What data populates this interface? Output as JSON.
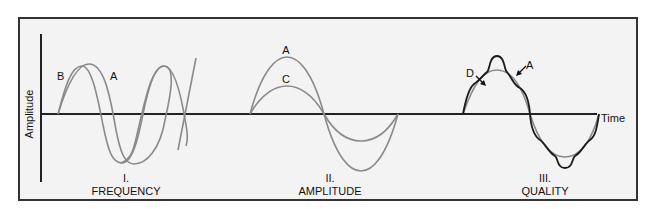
{
  "diagram": {
    "type": "sound-wave-properties",
    "axes": {
      "y_label": "Amplitude",
      "x_label": "Time"
    },
    "panels": [
      {
        "numeral": "I.",
        "title": "FREQUENCY",
        "curves": [
          {
            "label": "B",
            "description": "higher frequency wave"
          },
          {
            "label": "A",
            "description": "reference wave"
          }
        ]
      },
      {
        "numeral": "II.",
        "title": "AMPLITUDE",
        "curves": [
          {
            "label": "A",
            "description": "larger amplitude wave"
          },
          {
            "label": "C",
            "description": "smaller amplitude wave"
          }
        ]
      },
      {
        "numeral": "III.",
        "title": "QUALITY",
        "curves": [
          {
            "label": "D",
            "description": "complex waveform with harmonics"
          },
          {
            "label": "A",
            "description": "pure sine wave"
          }
        ]
      }
    ],
    "colors": {
      "frame_border": "#333333",
      "background": "#f3f3f3",
      "axis": "#222222",
      "wave_gray": "#8a8a8a",
      "wave_dark": "#1a1a1a"
    }
  }
}
